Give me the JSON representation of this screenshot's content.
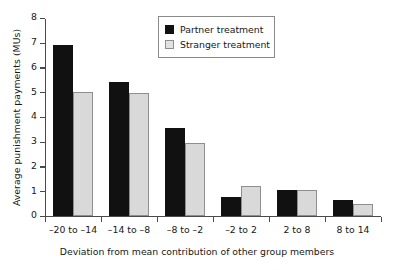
{
  "chart_data": {
    "type": "bar",
    "title": "",
    "xlabel": "Deviation from mean contribution of other group members",
    "ylabel": "Average punishment payments (MUs)",
    "categories": [
      "–20 to –14",
      "–14 to –8",
      "–8 to –2",
      "–2 to 2",
      "2 to 8",
      "8 to 14"
    ],
    "series": [
      {
        "name": "Partner treatment",
        "color": "#111111",
        "values": [
          6.9,
          5.4,
          3.55,
          0.75,
          1.05,
          0.65
        ]
      },
      {
        "name": "Stranger treatment",
        "color": "#d9d9d9",
        "values": [
          5.0,
          4.95,
          2.95,
          1.2,
          1.05,
          0.45
        ]
      }
    ],
    "ylim": [
      0,
      8
    ],
    "yticks": [
      "0",
      "1",
      "2",
      "3",
      "4",
      "5",
      "6",
      "7",
      "8"
    ],
    "grid": false,
    "legend_position": "top-center"
  },
  "legend": {
    "items": [
      {
        "label": "Partner treatment",
        "swatch": "partner"
      },
      {
        "label": "Stranger treatment",
        "swatch": "stranger"
      }
    ]
  }
}
